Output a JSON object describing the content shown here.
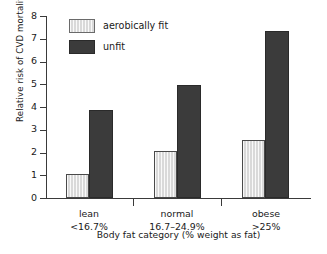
{
  "chart_data": {
    "type": "bar",
    "title": "",
    "subtitle": "",
    "xlabel": "Body fat category (% weight as fat)",
    "ylabel": "Relative risk of CVD mortality",
    "categories": [
      "lean",
      "normal",
      "obese"
    ],
    "category_ranges": [
      "<16.7%",
      "16.7–24.9%",
      ">25%"
    ],
    "series": [
      {
        "name": "aerobically fit",
        "color": "#d9d9d9",
        "values": [
          1.05,
          2.05,
          2.55
        ]
      },
      {
        "name": "unfit",
        "color": "#3b3b3b",
        "values": [
          3.85,
          4.95,
          7.35
        ]
      }
    ],
    "ylim": [
      0,
      8
    ],
    "ytick_labels": [
      "0",
      "1",
      "2",
      "3",
      "4",
      "5",
      "6",
      "7",
      "8"
    ],
    "ytick_values": [
      0,
      1,
      2,
      3,
      4,
      5,
      6,
      7,
      8
    ],
    "grid": false,
    "legend_position": "top-left-inside"
  },
  "legend": {
    "entries": [
      {
        "label": "aerobically fit"
      },
      {
        "label": "unfit"
      }
    ]
  },
  "axes": {
    "y_title": "Relative risk of CVD mortality",
    "x_title": "Body fat category (% weight as fat)"
  },
  "categories": [
    {
      "name": "lean",
      "range": "<16.7%"
    },
    {
      "name": "normal",
      "range": "16.7–24.9%"
    },
    {
      "name": "obese",
      "range": ">25%"
    }
  ],
  "yticks": [
    {
      "label": "8"
    },
    {
      "label": "7"
    },
    {
      "label": "6"
    },
    {
      "label": "5"
    },
    {
      "label": "4"
    },
    {
      "label": "3"
    },
    {
      "label": "2"
    },
    {
      "label": "1"
    },
    {
      "label": "0"
    }
  ]
}
